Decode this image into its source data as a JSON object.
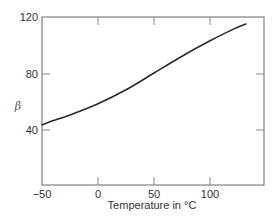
{
  "chart_data": {
    "type": "line",
    "title": "",
    "xlabel": "Temperature in °C",
    "ylabel": "β",
    "xlim": [
      -50,
      148
    ],
    "ylim": [
      0,
      120
    ],
    "x_ticks": [
      -50,
      0,
      50,
      100
    ],
    "x_tick_labels": [
      "−50",
      "0",
      "50",
      "100"
    ],
    "y_ticks": [
      40,
      80,
      120
    ],
    "y_tick_labels": [
      "40",
      "80",
      "120"
    ],
    "grid": false,
    "legend": null,
    "series": [
      {
        "name": "β vs Temperature",
        "x": [
          -50,
          -40,
          -25,
          0,
          25,
          50,
          75,
          100,
          120,
          132
        ],
        "values": [
          43,
          46,
          50,
          58,
          68,
          80,
          92,
          103,
          111,
          115
        ]
      }
    ],
    "colors": {
      "line": "#2a2a2a",
      "axis": "#666666"
    }
  }
}
